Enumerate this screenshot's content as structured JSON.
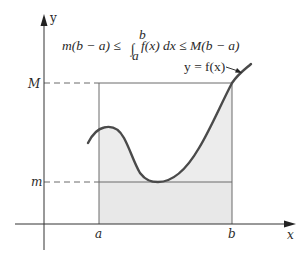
{
  "diagram": {
    "formula": {
      "left": "m(b − a) ≤",
      "integral_sign": "∫",
      "upper_limit": "b",
      "lower_limit": "a",
      "integrand": "f(x) dx ≤ M(b − a)"
    },
    "curve_label": "y = f(x)",
    "axes": {
      "x_label": "x",
      "y_label": "y"
    },
    "tick_labels": {
      "a": "a",
      "b": "b",
      "M": "M",
      "m": "m"
    },
    "colors": {
      "curve": "#4a4a4a",
      "axis": "#333333",
      "shaded_region": "#ececec",
      "rect_line": "#6a6a6a",
      "background": "#ffffff"
    }
  }
}
